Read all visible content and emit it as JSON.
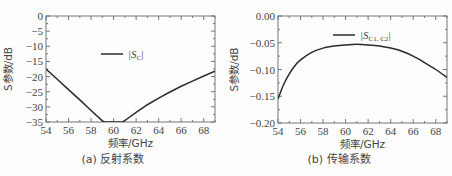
{
  "chart_data": [
    {
      "type": "line",
      "title": "",
      "caption": "(a) 反射系数",
      "xlabel": "频率/GHz",
      "ylabel": "S参数/dB",
      "xlim": [
        54,
        69
      ],
      "ylim": [
        -35,
        0
      ],
      "xticks": [
        54,
        56,
        58,
        60,
        62,
        64,
        66,
        68
      ],
      "yticks": [
        0,
        -5,
        -10,
        -15,
        -20,
        -25,
        -30,
        -35
      ],
      "grid": false,
      "legend_position": "upper-center",
      "series": [
        {
          "name": "|S_C|",
          "x": [
            54,
            55,
            56,
            57,
            58,
            59,
            59.2,
            60.8,
            61,
            62,
            63,
            64,
            65,
            66,
            67,
            68,
            69
          ],
          "values": [
            -17.5,
            -20.9,
            -24.3,
            -27.7,
            -31.2,
            -34.6,
            -35,
            -35,
            -34.5,
            -31.8,
            -29.3,
            -27.1,
            -25.1,
            -23.2,
            -21.5,
            -19.8,
            -18.2
          ]
        }
      ]
    },
    {
      "type": "line",
      "title": "",
      "caption": "(b) 传输系数",
      "xlabel": "频率/GHz",
      "ylabel": "S参数/dB",
      "xlim": [
        54,
        69
      ],
      "ylim": [
        -0.2,
        0
      ],
      "xticks": [
        54,
        56,
        58,
        60,
        62,
        64,
        66,
        68
      ],
      "yticks": [
        0.0,
        -0.05,
        -0.1,
        -0.15,
        -0.2
      ],
      "grid": false,
      "legend_position": "upper-center",
      "series": [
        {
          "name": "|S_C1,C2|",
          "x": [
            54,
            54.5,
            55,
            55.5,
            56,
            57,
            58,
            59,
            60,
            61,
            62,
            63,
            64,
            65,
            66,
            67,
            68,
            69
          ],
          "values": [
            -0.155,
            -0.128,
            -0.108,
            -0.093,
            -0.082,
            -0.068,
            -0.06,
            -0.056,
            -0.054,
            -0.053,
            -0.054,
            -0.056,
            -0.06,
            -0.066,
            -0.075,
            -0.087,
            -0.1,
            -0.115
          ]
        }
      ]
    }
  ],
  "panels": {
    "a": {
      "caption": "(a) 反射系数",
      "xlabel": "频率/GHz",
      "ylabel": "S参数/dB",
      "legend_main": "|S",
      "legend_sub": "C",
      "legend_end": "|",
      "xtick_labels": [
        "54",
        "56",
        "58",
        "60",
        "62",
        "64",
        "66",
        "68"
      ],
      "ytick_labels": [
        "0",
        "−5",
        "−10",
        "−15",
        "−20",
        "−25",
        "−30",
        "−35"
      ]
    },
    "b": {
      "caption": "(b) 传输系数",
      "xlabel": "频率/GHz",
      "ylabel": "S参数/dB",
      "legend_main": "|S",
      "legend_sub": "C1, C2",
      "legend_end": "|",
      "xtick_labels": [
        "54",
        "56",
        "58",
        "60",
        "62",
        "64",
        "66",
        "68"
      ],
      "ytick_labels": [
        "0.00",
        "−0.05",
        "−0.10",
        "−0.15",
        "−0.20"
      ]
    }
  },
  "colors": {
    "curve": "#2b2b2b",
    "axis": "#777777"
  }
}
